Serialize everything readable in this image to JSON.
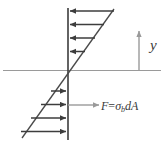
{
  "figure": {
    "kind": "bending-stress-distribution-diagram",
    "labels": {
      "y_axis": "y",
      "force_F": "F",
      "force_equals": "=",
      "force_sigma": "σ",
      "force_sigma_sub": "b",
      "force_dA": "dA",
      "force_full": "F = σbdA"
    },
    "colors": {
      "arrow": "#3d3d3d",
      "axis_line": "#9a9a9a",
      "diagonal": "#4a4a4a",
      "vertical_line": "#3d3d3d",
      "highlight_arrow": "#9a9a9a",
      "text": "#3a3a3a",
      "background": "#ffffff"
    },
    "geometry": {
      "vertical_axis_x": 68,
      "horizontal_axis_y": 70.5,
      "horizontal_axis_x0": 3,
      "horizontal_axis_x1": 161,
      "vertical_axis_y0": 8,
      "vertical_axis_y1": 140,
      "diagonal_x0": 22,
      "diagonal_y0": 138,
      "diagonal_x1": 114,
      "diagonal_y1": 9
    },
    "arrows_upper": [
      {
        "name": "compression-arrow-1",
        "y": 11,
        "tail_x": 114,
        "head_x": 69
      },
      {
        "name": "compression-arrow-2",
        "y": 24.5,
        "tail_x": 104,
        "head_x": 69
      },
      {
        "name": "compression-arrow-3",
        "y": 38,
        "tail_x": 95,
        "head_x": 69
      },
      {
        "name": "compression-arrow-4",
        "y": 51.5,
        "tail_x": 85,
        "head_x": 69
      }
    ],
    "arrows_lower": [
      {
        "name": "tension-arrow-1",
        "y": 91,
        "tail_x": 51,
        "head_x": 67
      },
      {
        "name": "tension-arrow-2",
        "y": 104.5,
        "tail_x": 41,
        "head_x": 67
      },
      {
        "name": "tension-arrow-3",
        "y": 118,
        "tail_x": 31,
        "head_x": 67
      },
      {
        "name": "tension-arrow-4",
        "y": 131.5,
        "tail_x": 21,
        "head_x": 67
      }
    ],
    "force_arrow": {
      "name": "resultant-force-arrow",
      "y": 105,
      "tail_x": 68,
      "head_x": 98
    },
    "y_arrow": {
      "name": "y-axis-arrow",
      "x": 139,
      "tail_y": 70,
      "head_y": 30
    }
  }
}
